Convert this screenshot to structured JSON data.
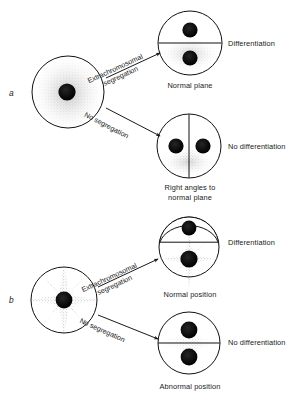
{
  "figure": {
    "type": "biological-schematic",
    "panels": [
      {
        "letter": "a",
        "parent_cell": {
          "name": "parent-cell-a",
          "cytoplasm_pattern": "diffuse-stipple-cloud",
          "nucleus_count": 1
        },
        "branches": [
          {
            "arrow_label_line1": "Extrachromosomal",
            "arrow_label_line2": "segregation",
            "daughter_caption": "Normal plane",
            "outcome": "Differentiation",
            "division_plane": "horizontal",
            "nucleus_count": 2
          },
          {
            "arrow_label_line1": "No segregation",
            "arrow_label_line2": "",
            "daughter_caption_line1": "Right angles to",
            "daughter_caption_line2": "normal plane",
            "outcome": "No differentiation",
            "division_plane": "vertical",
            "nucleus_count": 2
          }
        ]
      },
      {
        "letter": "b",
        "parent_cell": {
          "name": "parent-cell-b",
          "cytoplasm_pattern": "four-pointed-star-stipple",
          "nucleus_count": 1
        },
        "branches": [
          {
            "arrow_label_line1": "Extrachromosomal",
            "arrow_label_line2": "segregation",
            "daughter_caption": "Normal position",
            "outcome": "Differentiation",
            "division_plane": "horizontal-constricted",
            "nucleus_count": 2
          },
          {
            "arrow_label_line1": "No segregation",
            "arrow_label_line2": "",
            "daughter_caption": "Abnormal position",
            "outcome": "No differentiation",
            "division_plane": "horizontal",
            "nucleus_count": 2
          }
        ]
      }
    ],
    "colors": {
      "ink": "#1a1a1a",
      "outline": "#111111",
      "nucleus": "#0d0d0d",
      "stipple": "#555555",
      "background": "#ffffff"
    }
  }
}
